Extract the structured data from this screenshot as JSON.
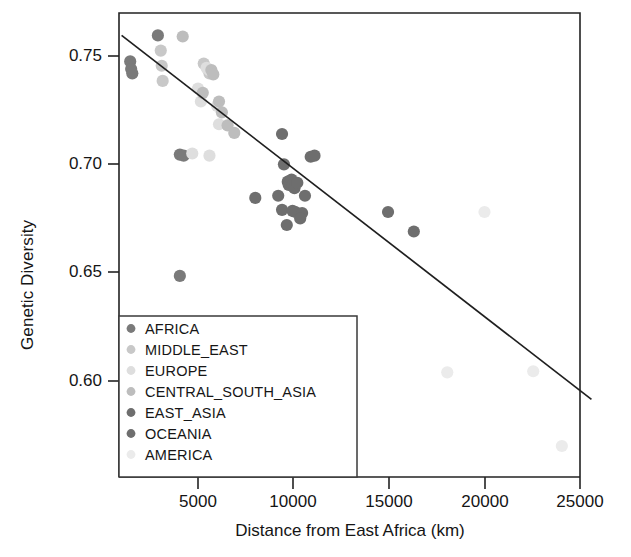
{
  "chart_data": {
    "type": "scatter",
    "title": "",
    "xlabel": "Distance from East Africa (km)",
    "ylabel": "Genetic Diversity",
    "xlim": [
      1000,
      25600
    ],
    "ylim": [
      0.5655,
      0.7685
    ],
    "xticks": [
      5000,
      10000,
      15000,
      20000,
      25000
    ],
    "xtick_labels": [
      "5000",
      "10000",
      "15000",
      "20000",
      "25000"
    ],
    "yticks": [
      0.75,
      0.7,
      0.65,
      0.6
    ],
    "ytick_labels": [
      "0.75",
      "0.70",
      "0.65",
      "0.60"
    ],
    "grid": false,
    "legend_position": "bottom-left",
    "trendline": {
      "label": "linear regression fit",
      "x_start": 1000,
      "y_start": 0.7595,
      "x_end": 25600,
      "y_end": 0.5915
    },
    "series": [
      {
        "name": "AFRICA",
        "color": "#7a7a7a",
        "points": [
          {
            "x": 1450,
            "y": 0.7475
          },
          {
            "x": 1500,
            "y": 0.744
          },
          {
            "x": 1560,
            "y": 0.742
          },
          {
            "x": 2900,
            "y": 0.7595
          },
          {
            "x": 4050,
            "y": 0.7045
          },
          {
            "x": 4250,
            "y": 0.704
          },
          {
            "x": 4050,
            "y": 0.6485
          }
        ]
      },
      {
        "name": "MIDDLE_EAST",
        "color": "#c8c8c8",
        "points": [
          {
            "x": 3050,
            "y": 0.7525
          },
          {
            "x": 3100,
            "y": 0.7455
          },
          {
            "x": 3150,
            "y": 0.7385
          },
          {
            "x": 5300,
            "y": 0.7465
          },
          {
            "x": 5600,
            "y": 0.742
          }
        ]
      },
      {
        "name": "EUROPE",
        "color": "#dedede",
        "points": [
          {
            "x": 5000,
            "y": 0.735
          },
          {
            "x": 5150,
            "y": 0.729
          },
          {
            "x": 5450,
            "y": 0.7445
          },
          {
            "x": 5600,
            "y": 0.7435
          },
          {
            "x": 6000,
            "y": 0.727
          },
          {
            "x": 6100,
            "y": 0.7185
          },
          {
            "x": 4700,
            "y": 0.705
          },
          {
            "x": 5600,
            "y": 0.704
          }
        ]
      },
      {
        "name": "CENTRAL_SOUTH_ASIA",
        "color": "#bdbdbd",
        "points": [
          {
            "x": 4200,
            "y": 0.759
          },
          {
            "x": 5250,
            "y": 0.733
          },
          {
            "x": 5700,
            "y": 0.7435
          },
          {
            "x": 5800,
            "y": 0.7415
          },
          {
            "x": 6100,
            "y": 0.729
          },
          {
            "x": 6250,
            "y": 0.724
          },
          {
            "x": 6550,
            "y": 0.718
          },
          {
            "x": 6900,
            "y": 0.7145
          }
        ]
      },
      {
        "name": "EAST_ASIA",
        "color": "#6e6e6e",
        "points": [
          {
            "x": 8000,
            "y": 0.6845
          },
          {
            "x": 9400,
            "y": 0.714
          },
          {
            "x": 9500,
            "y": 0.7
          },
          {
            "x": 9700,
            "y": 0.692
          },
          {
            "x": 9750,
            "y": 0.6905
          },
          {
            "x": 9900,
            "y": 0.693
          },
          {
            "x": 9950,
            "y": 0.6905
          },
          {
            "x": 10050,
            "y": 0.689
          },
          {
            "x": 10200,
            "y": 0.6915
          },
          {
            "x": 9200,
            "y": 0.6855
          },
          {
            "x": 9400,
            "y": 0.679
          },
          {
            "x": 9950,
            "y": 0.6785
          },
          {
            "x": 10100,
            "y": 0.678
          },
          {
            "x": 10450,
            "y": 0.6775
          },
          {
            "x": 10600,
            "y": 0.6855
          },
          {
            "x": 9650,
            "y": 0.672
          },
          {
            "x": 10350,
            "y": 0.675
          },
          {
            "x": 10900,
            "y": 0.7035
          },
          {
            "x": 11100,
            "y": 0.704
          }
        ]
      },
      {
        "name": "OCEANIA",
        "color": "#6e6e6e",
        "points": [
          {
            "x": 14950,
            "y": 0.678
          },
          {
            "x": 16300,
            "y": 0.669
          }
        ]
      },
      {
        "name": "AMERICA",
        "color": "#ebebeb",
        "points": [
          {
            "x": 18050,
            "y": 0.604
          },
          {
            "x": 20000,
            "y": 0.678
          },
          {
            "x": 22550,
            "y": 0.6045
          },
          {
            "x": 24050,
            "y": 0.57
          }
        ]
      }
    ]
  },
  "legend": {
    "entries": [
      {
        "label": "AFRICA"
      },
      {
        "label": "MIDDLE_EAST"
      },
      {
        "label": "EUROPE"
      },
      {
        "label": "CENTRAL_SOUTH_ASIA"
      },
      {
        "label": "EAST_ASIA"
      },
      {
        "label": "OCEANIA"
      },
      {
        "label": "AMERICA"
      }
    ]
  },
  "axes": {
    "y_title": "Genetic Diversity",
    "x_title": "Distance from East Africa (km)",
    "y_tick_0": "0.75",
    "y_tick_1": "0.70",
    "y_tick_2": "0.65",
    "y_tick_3": "0.60",
    "x_tick_0": "5000",
    "x_tick_1": "10000",
    "x_tick_2": "15000",
    "x_tick_3": "20000",
    "x_tick_4": "25000"
  },
  "colors": {
    "axis": "#222222",
    "trendline": "#1f1f1f",
    "background": "#ffffff"
  }
}
